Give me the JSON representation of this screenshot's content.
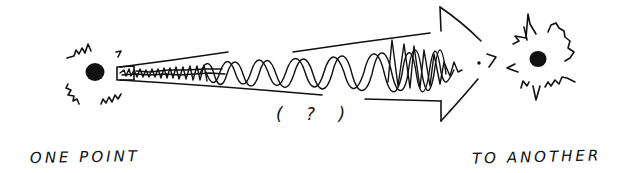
{
  "diagram": {
    "source_label": "ONE POINT",
    "target_label": "TO ANOTHER",
    "middle_annotation": "( ? )",
    "colors": {
      "ink": "#111111",
      "background": "#ffffff"
    },
    "nodes": [
      {
        "id": "source",
        "shape": "burst-dot",
        "label": "ONE POINT"
      },
      {
        "id": "target",
        "shape": "burst-dot",
        "label": "TO ANOTHER"
      }
    ],
    "edges": [
      {
        "from": "source",
        "to": "target",
        "shape": "tapered-arrow",
        "content": "wave of increasing amplitude",
        "annotation": "( ? )"
      }
    ]
  }
}
